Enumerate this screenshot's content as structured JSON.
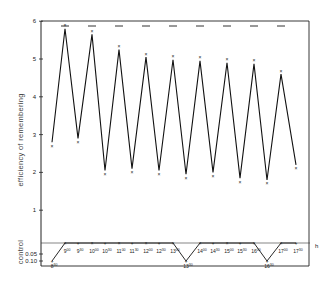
{
  "chart_data": {
    "type": "line",
    "title": "",
    "xlabel": "h",
    "ylabel": "efficiency of remembering",
    "ylabel_lower": "control",
    "ylim": [
      0,
      6
    ],
    "yticks": [
      "1",
      "2",
      "3",
      "4",
      "5",
      "6"
    ],
    "control_ticks": [
      "0.05",
      "0.10"
    ],
    "grid": false,
    "legend": null,
    "series": [
      {
        "name": "efficiency of remembering",
        "points": [
          {
            "x": 0,
            "y": 2.8
          },
          {
            "x": 1,
            "y": 5.8
          },
          {
            "x": 2,
            "y": 2.9
          },
          {
            "x": 3,
            "y": 5.65
          },
          {
            "x": 4,
            "y": 2.05
          },
          {
            "x": 5,
            "y": 5.25
          },
          {
            "x": 6,
            "y": 2.1
          },
          {
            "x": 7,
            "y": 5.05
          },
          {
            "x": 8,
            "y": 2.05
          },
          {
            "x": 9,
            "y": 4.98
          },
          {
            "x": 10,
            "y": 1.95
          },
          {
            "x": 11,
            "y": 4.95
          },
          {
            "x": 12,
            "y": 2.0
          },
          {
            "x": 13,
            "y": 4.9
          },
          {
            "x": 14,
            "y": 1.85
          },
          {
            "x": 15,
            "y": 4.87
          },
          {
            "x": 16,
            "y": 1.8
          },
          {
            "x": 17,
            "y": 4.6
          },
          {
            "x": 18,
            "y": 2.2
          }
        ]
      },
      {
        "name": "control",
        "points": [
          {
            "x": 0,
            "y": 0.1
          },
          {
            "x": 1,
            "y": 0.0
          },
          {
            "x": 2,
            "y": 0.0
          },
          {
            "x": 3,
            "y": 0.0
          },
          {
            "x": 4,
            "y": 0.0
          },
          {
            "x": 5,
            "y": 0.0
          },
          {
            "x": 6,
            "y": 0.0
          },
          {
            "x": 7,
            "y": 0.0
          },
          {
            "x": 8,
            "y": 0.0
          },
          {
            "x": 9,
            "y": 0.0
          },
          {
            "x": 10,
            "y": 0.1
          },
          {
            "x": 11,
            "y": 0.0
          },
          {
            "x": 12,
            "y": 0.0
          },
          {
            "x": 13,
            "y": 0.0
          },
          {
            "x": 14,
            "y": 0.0
          },
          {
            "x": 15,
            "y": 0.0
          },
          {
            "x": 16,
            "y": 0.1
          },
          {
            "x": 17,
            "y": 0.0
          },
          {
            "x": 18,
            "y": 0.0
          }
        ]
      }
    ],
    "categories": [
      "8:30",
      "9:00",
      "9:30",
      "10:00",
      "10:30",
      "11:00",
      "11:30",
      "12:00",
      "12:30",
      "13:00",
      "13:30",
      "14:00",
      "14:30",
      "15:00",
      "15:30",
      "16:00",
      "16:30",
      "17:00",
      "17:30"
    ],
    "time_labels": [
      {
        "h": "8",
        "m": "30"
      },
      {
        "h": "9",
        "m": "00"
      },
      {
        "h": "9",
        "m": "30"
      },
      {
        "h": "10",
        "m": "00"
      },
      {
        "h": "10",
        "m": "30"
      },
      {
        "h": "11",
        "m": "00"
      },
      {
        "h": "11",
        "m": "30"
      },
      {
        "h": "12",
        "m": "00"
      },
      {
        "h": "12",
        "m": "30"
      },
      {
        "h": "13",
        "m": "00"
      },
      {
        "h": "13",
        "m": "30"
      },
      {
        "h": "14",
        "m": "00"
      },
      {
        "h": "14",
        "m": "30"
      },
      {
        "h": "15",
        "m": "00"
      },
      {
        "h": "15",
        "m": "30"
      },
      {
        "h": "16",
        "m": "00"
      },
      {
        "h": "16",
        "m": "30"
      },
      {
        "h": "17",
        "m": "00"
      },
      {
        "h": "17",
        "m": "30"
      }
    ],
    "max_marks_at_6": true
  }
}
